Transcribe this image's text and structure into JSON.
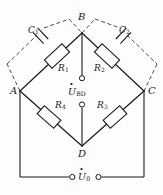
{
  "figure": {
    "type": "circuit-diagram",
    "stroke_color": "#1a1a1a",
    "dashed_color": "#4a4a4a",
    "background": "#fdfdfd"
  },
  "nodes": [
    {
      "id": "A",
      "label": "A",
      "x": 20,
      "y": 91
    },
    {
      "id": "B",
      "label": "B",
      "x": 82,
      "y": 33
    },
    {
      "id": "C",
      "label": "C",
      "x": 144,
      "y": 91
    },
    {
      "id": "D",
      "label": "D",
      "x": 82,
      "y": 146
    }
  ],
  "components": [
    {
      "id": "R1",
      "label": "R",
      "sub": "1",
      "kind": "resistor",
      "between": "A-B"
    },
    {
      "id": "R2",
      "label": "R",
      "sub": "2",
      "kind": "resistor",
      "between": "B-C"
    },
    {
      "id": "R3",
      "label": "R",
      "sub": "3",
      "kind": "resistor",
      "between": "C-D"
    },
    {
      "id": "R4",
      "label": "R",
      "sub": "4",
      "kind": "resistor",
      "between": "D-A"
    },
    {
      "id": "C1",
      "label": "C",
      "sub": "1",
      "kind": "capacitor",
      "between": "A-B",
      "style": "dashed"
    },
    {
      "id": "C2",
      "label": "C",
      "sub": "2",
      "kind": "capacitor",
      "between": "B-C",
      "style": "dashed"
    }
  ],
  "sources": [
    {
      "id": "U_BD",
      "label": "U",
      "sub": "BD",
      "phasor": true,
      "kind": "output-terminals",
      "between": "B-D"
    },
    {
      "id": "U_0",
      "label": "U",
      "sub": "0",
      "phasor": true,
      "kind": "input-terminals",
      "between": "A-C"
    }
  ],
  "labels": {
    "node_A": "A",
    "node_B": "B",
    "node_C": "C",
    "node_D": "D",
    "r1": "R",
    "r1_sub": "1",
    "r2": "R",
    "r2_sub": "2",
    "r3": "R",
    "r3_sub": "3",
    "r4": "R",
    "r4_sub": "4",
    "c1": "C",
    "c1_sub": "1",
    "c2": "C",
    "c2_sub": "2",
    "u_bd": "U",
    "u_bd_sub": "BD",
    "u_0": "U",
    "u_0_sub": "0"
  }
}
